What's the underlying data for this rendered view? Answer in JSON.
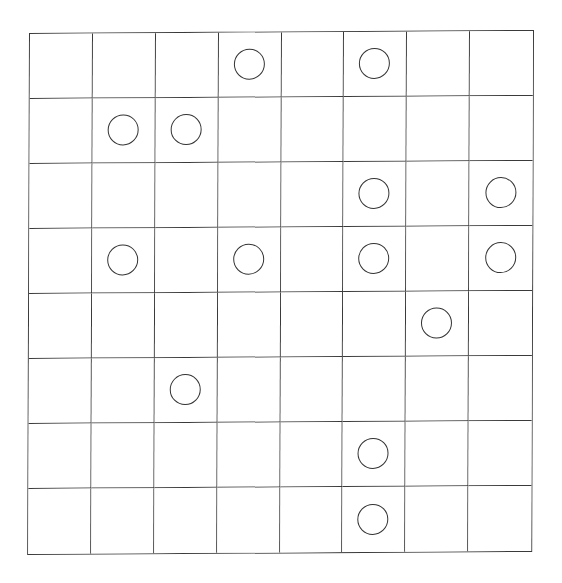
{
  "board": {
    "rows": 8,
    "cols": 8,
    "line_color": "#3a3a3a",
    "circle_color": "#333333",
    "background": "#ffffff",
    "cells": [
      [
        "",
        "",
        "",
        "circle",
        "",
        "circle",
        "",
        ""
      ],
      [
        "",
        "circle",
        "circle",
        "",
        "",
        "",
        "",
        ""
      ],
      [
        "",
        "",
        "",
        "",
        "",
        "circle",
        "",
        "circle"
      ],
      [
        "",
        "circle",
        "",
        "circle",
        "",
        "circle",
        "",
        "circle"
      ],
      [
        "",
        "",
        "",
        "",
        "",
        "",
        "circle",
        ""
      ],
      [
        "",
        "",
        "circle",
        "",
        "",
        "",
        "",
        ""
      ],
      [
        "",
        "",
        "",
        "",
        "",
        "circle",
        "",
        ""
      ],
      [
        "",
        "",
        "",
        "",
        "",
        "circle",
        "",
        ""
      ]
    ],
    "circles": [
      {
        "row": 0,
        "col": 3
      },
      {
        "row": 0,
        "col": 5
      },
      {
        "row": 1,
        "col": 1
      },
      {
        "row": 1,
        "col": 2
      },
      {
        "row": 2,
        "col": 5
      },
      {
        "row": 2,
        "col": 7
      },
      {
        "row": 3,
        "col": 1
      },
      {
        "row": 3,
        "col": 3
      },
      {
        "row": 3,
        "col": 5
      },
      {
        "row": 3,
        "col": 7
      },
      {
        "row": 4,
        "col": 6
      },
      {
        "row": 5,
        "col": 2
      },
      {
        "row": 6,
        "col": 5
      },
      {
        "row": 7,
        "col": 5
      }
    ],
    "circle_count": 14
  }
}
